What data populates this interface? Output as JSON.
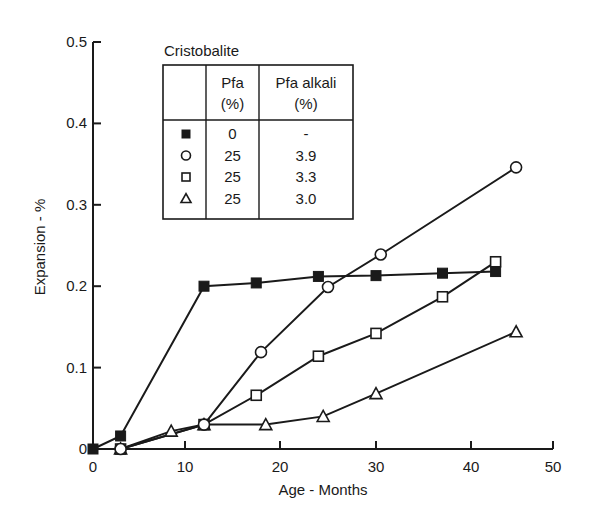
{
  "chart_data": {
    "type": "line",
    "title": "",
    "legend_title": "Cristobalite",
    "xlabel": "Age - Months",
    "ylabel": "Expansion - %",
    "xlim": [
      0,
      50
    ],
    "ylim": [
      0,
      0.5
    ],
    "xticks": [
      0,
      10,
      20,
      30,
      40,
      50
    ],
    "xtick_labels": [
      "0",
      "10",
      "20",
      "30",
      "40",
      "50"
    ],
    "yticks": [
      0,
      0.1,
      0.2,
      0.3,
      0.4,
      0.5
    ],
    "ytick_labels": [
      "0",
      "0.1",
      "0.2",
      "0.3",
      "0.4",
      "0.5"
    ],
    "grid": false,
    "legend_position": "upper-left (table inside plot)",
    "legend_table": {
      "headers": [
        "",
        "Pfa\n(%)",
        "Pfa alkali\n(%)"
      ],
      "header_line1": [
        "",
        "Pfa",
        "Pfa alkali"
      ],
      "header_line2": [
        "",
        "(%)",
        "(%)"
      ],
      "rows": [
        {
          "marker": "filled-square",
          "pfa": "0",
          "pfa_alkali": "-"
        },
        {
          "marker": "open-circle",
          "pfa": "25",
          "pfa_alkali": "3.9"
        },
        {
          "marker": "open-square",
          "pfa": "25",
          "pfa_alkali": "3.3"
        },
        {
          "marker": "open-triangle",
          "pfa": "25",
          "pfa_alkali": "3.0"
        }
      ]
    },
    "series": [
      {
        "name": "Pfa 0%, Pfa alkali -",
        "marker": "filled-square",
        "x": [
          0,
          3,
          12,
          17.5,
          24,
          30,
          37,
          43
        ],
        "y": [
          0,
          0.016,
          0.2,
          0.204,
          0.212,
          0.213,
          0.216,
          0.218
        ]
      },
      {
        "name": "Pfa 25%, Pfa alkali 3.9%",
        "marker": "open-circle",
        "x": [
          3,
          12,
          18,
          25,
          30.5,
          45.5
        ],
        "y": [
          0,
          0.03,
          0.119,
          0.199,
          0.239,
          0.346
        ]
      },
      {
        "name": "Pfa 25%, Pfa alkali 3.3%",
        "marker": "open-square",
        "x": [
          3,
          12,
          17.5,
          24,
          30,
          37,
          43
        ],
        "y": [
          0,
          0.03,
          0.066,
          0.114,
          0.142,
          0.187,
          0.23
        ]
      },
      {
        "name": "Pfa 25%, Pfa alkali 3.0%",
        "marker": "open-triangle",
        "x": [
          3,
          8.5,
          12,
          18.5,
          24.5,
          30,
          45.5
        ],
        "y": [
          0,
          0.022,
          0.03,
          0.03,
          0.04,
          0.068,
          0.144
        ]
      }
    ]
  },
  "colors": {
    "ink": "#1a1a1a",
    "background": "#ffffff"
  }
}
